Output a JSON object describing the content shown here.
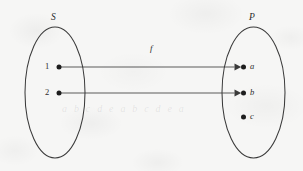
{
  "figure": {
    "type": "function-mapping-diagram",
    "caption_ghost": "a b c d e a   b c d e a",
    "map_label": "f",
    "colors": {
      "background": "#f6f6f5",
      "stroke": "#3a3a3a",
      "dot": "#1d1d1d",
      "text": "#2b2b2b"
    },
    "domain_set": {
      "name": "S",
      "label_x": 55,
      "label_y": 14,
      "ellipse": {
        "cx": 55,
        "cy": 92.5,
        "rx": 30,
        "ry": 65.5
      },
      "elements": [
        {
          "label": "1",
          "dot_x": 59,
          "dot_y": 67,
          "label_x": 47,
          "label_y": 62.5
        },
        {
          "label": "2",
          "dot_x": 59,
          "dot_y": 93,
          "label_x": 47,
          "label_y": 88.5
        }
      ]
    },
    "codomain_set": {
      "name": "P",
      "label_x": 252,
      "label_y": 14,
      "ellipse": {
        "cx": 253.5,
        "cy": 92.5,
        "rx": 31.5,
        "ry": 65.5
      },
      "elements": [
        {
          "label": "a",
          "dot_x": 243,
          "dot_y": 67,
          "label_x": 250,
          "label_y": 62.5
        },
        {
          "label": "b",
          "dot_x": 243,
          "dot_y": 93,
          "label_x": 250,
          "label_y": 88.5
        },
        {
          "label": "c",
          "dot_x": 243,
          "dot_y": 117,
          "label_x": 250,
          "label_y": 112.5
        }
      ]
    },
    "mappings": [
      {
        "from": "1",
        "to": "a",
        "x1": 61,
        "y1": 67,
        "x2": 240,
        "y2": 67
      },
      {
        "from": "2",
        "to": "b",
        "x1": 61,
        "y1": 93,
        "x2": 240,
        "y2": 93
      }
    ],
    "map_label_x": 149,
    "map_label_y": 45
  }
}
